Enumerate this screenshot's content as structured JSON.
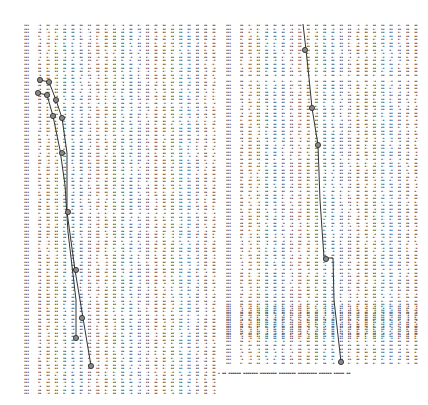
{
  "document": {
    "type": "scanned numeric table printout with plotted curves",
    "panels": [
      {
        "id": "left",
        "blocks": [
          {
            "x": 24,
            "y": 24,
            "rows": 60,
            "label_col": true,
            "data_cols": 22,
            "col_width": 8.3
          },
          {
            "x": 24,
            "y": 236,
            "rows": 45,
            "label_col": true,
            "data_cols": 22,
            "col_width": 8.3
          }
        ],
        "curves": [
          {
            "name": "upper-curve",
            "points": [
              [
                40,
                80
              ],
              [
                49,
                82
              ],
              [
                56,
                100
              ],
              [
                62,
                118
              ],
              [
                67,
                153
              ],
              [
                67,
                212
              ],
              [
                75,
                270
              ],
              [
                83,
                318
              ],
              [
                91,
                366
              ]
            ]
          },
          {
            "name": "lower-curve",
            "points": [
              [
                38,
                93
              ],
              [
                47,
                95
              ],
              [
                53,
                116
              ],
              [
                60,
                150
              ],
              [
                65,
                185
              ],
              [
                68,
                232
              ],
              [
                76,
                300
              ],
              [
                76,
                340
              ]
            ]
          }
        ],
        "markers": [
          [
            40,
            80
          ],
          [
            49,
            82
          ],
          [
            38,
            93
          ],
          [
            47,
            95
          ],
          [
            56,
            100
          ],
          [
            53,
            116
          ],
          [
            62,
            118
          ],
          [
            62,
            153
          ],
          [
            68,
            212
          ],
          [
            76,
            270
          ],
          [
            76,
            338
          ],
          [
            82,
            318
          ],
          [
            91,
            366
          ]
        ]
      },
      {
        "id": "right",
        "blocks": [
          {
            "x": 226,
            "y": 24,
            "rows": 15,
            "label_col": true,
            "data_cols": 22,
            "col_width": 8.3
          },
          {
            "x": 226,
            "y": 80,
            "rows": 73,
            "label_col": true,
            "data_cols": 22,
            "col_width": 8.3
          },
          {
            "x": 226,
            "y": 305,
            "rows": 17,
            "label_col": true,
            "data_cols": 22,
            "col_width": 8.3
          }
        ],
        "curves": [
          {
            "name": "right-curve",
            "points": [
              [
                303,
                24
              ],
              [
                306,
                50
              ],
              [
                309,
                78
              ],
              [
                312,
                108
              ],
              [
                318,
                145
              ],
              [
                320,
                200
              ],
              [
                324,
                258
              ],
              [
                333,
                258
              ],
              [
                334,
                300
              ],
              [
                341,
                362
              ]
            ]
          }
        ],
        "markers": [
          [
            305,
            50
          ],
          [
            312,
            108
          ],
          [
            318,
            145
          ],
          [
            326,
            259
          ],
          [
            341,
            362
          ]
        ]
      }
    ],
    "footer": {
      "text": "illegible caption line"
    }
  },
  "colors": {
    "ink": "#2a2a2a",
    "curve": "#333333",
    "paper": "#ffffff"
  }
}
